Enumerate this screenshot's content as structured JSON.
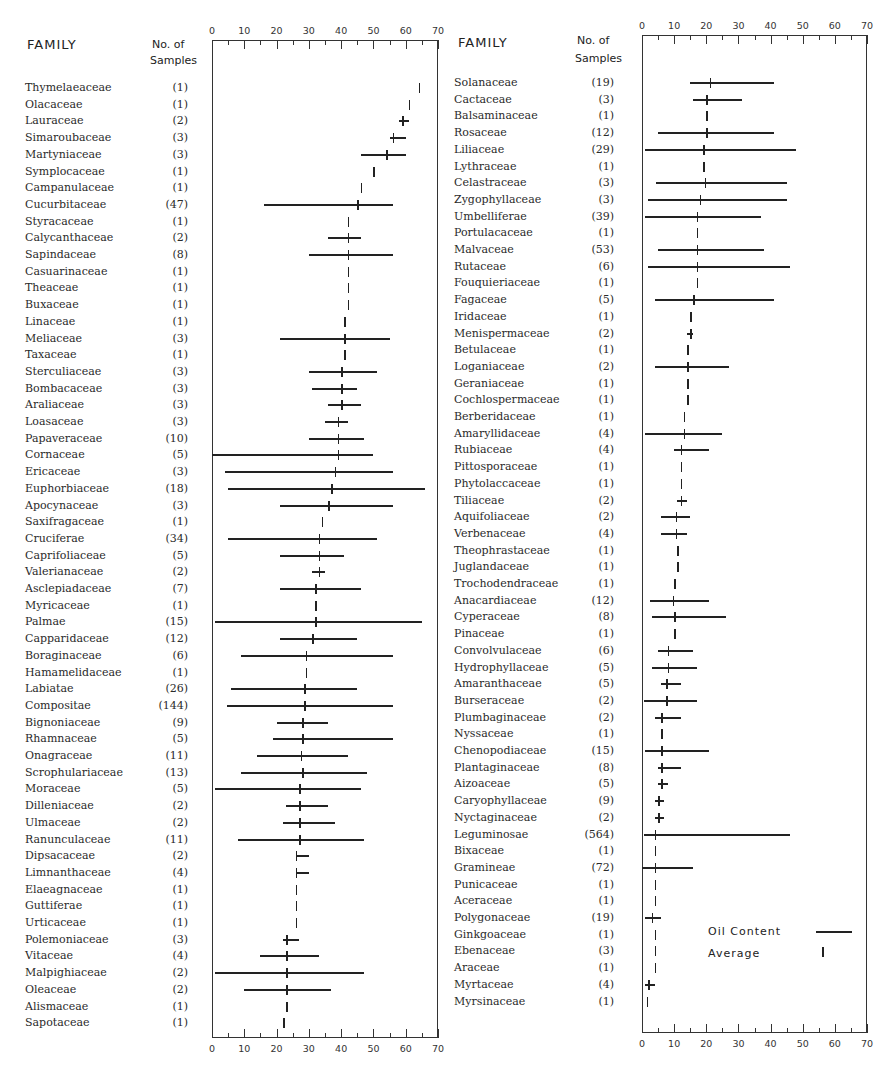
{
  "headers": {
    "family": "FAMILY",
    "samples_line1": "No. of",
    "samples_line2": "Samples"
  },
  "legend": {
    "oil_content": "Oil Content",
    "average": "Average"
  },
  "axis": {
    "ticks": [
      0,
      10,
      20,
      30,
      40,
      50,
      60,
      70
    ],
    "tick_labels": [
      "0",
      "10",
      "20",
      "30",
      "40",
      "50",
      "60",
      "70"
    ]
  },
  "chart_data": [
    {
      "type": "range-bar",
      "title": "Oil content by plant family (left panel)",
      "xlabel": "Oil content (%)",
      "xlim": [
        0,
        70
      ],
      "legend": [
        "Oil Content (range)",
        "Average"
      ],
      "rows": [
        {
          "family": "Thymelaeaceae",
          "n": "(1)",
          "avg": 64,
          "min": null,
          "max": null
        },
        {
          "family": "Olacaceae",
          "n": "(1)",
          "avg": 61,
          "min": null,
          "max": null
        },
        {
          "family": "Lauraceae",
          "n": "(2)",
          "avg": 59,
          "min": 58,
          "max": 61
        },
        {
          "family": "Simaroubaceae",
          "n": "(3)",
          "avg": 56,
          "min": 55,
          "max": 60
        },
        {
          "family": "Martyniaceae",
          "n": "(3)",
          "avg": 54,
          "min": 46,
          "max": 60
        },
        {
          "family": "Symplocaceae",
          "n": "(1)",
          "avg": 50,
          "min": null,
          "max": null
        },
        {
          "family": "Campanulaceae",
          "n": "(1)",
          "avg": 46,
          "min": null,
          "max": null
        },
        {
          "family": "Cucurbitaceae",
          "n": "(47)",
          "avg": 45,
          "min": 16,
          "max": 56
        },
        {
          "family": "Styracaceae",
          "n": "(1)",
          "avg": 42,
          "min": null,
          "max": null
        },
        {
          "family": "Calycanthaceae",
          "n": "(2)",
          "avg": 42,
          "min": 36,
          "max": 46
        },
        {
          "family": "Sapindaceae",
          "n": "(8)",
          "avg": 42,
          "min": 30,
          "max": 56
        },
        {
          "family": "Casuarinaceae",
          "n": "(1)",
          "avg": 42,
          "min": null,
          "max": null
        },
        {
          "family": "Theaceae",
          "n": "(1)",
          "avg": 42,
          "min": null,
          "max": null
        },
        {
          "family": "Buxaceae",
          "n": "(1)",
          "avg": 42,
          "min": null,
          "max": null
        },
        {
          "family": "Linaceae",
          "n": "(1)",
          "avg": 41,
          "min": null,
          "max": null
        },
        {
          "family": "Meliaceae",
          "n": "(3)",
          "avg": 41,
          "min": 21,
          "max": 55
        },
        {
          "family": "Taxaceae",
          "n": "(1)",
          "avg": 41,
          "min": null,
          "max": null
        },
        {
          "family": "Sterculiaceae",
          "n": "(3)",
          "avg": 40,
          "min": 30,
          "max": 51
        },
        {
          "family": "Bombacaceae",
          "n": "(3)",
          "avg": 40,
          "min": 31,
          "max": 45
        },
        {
          "family": "Araliaceae",
          "n": "(3)",
          "avg": 40,
          "min": 36,
          "max": 46
        },
        {
          "family": "Loasaceae",
          "n": "(3)",
          "avg": 39,
          "min": 35,
          "max": 42
        },
        {
          "family": "Papaveraceae",
          "n": "(10)",
          "avg": 39,
          "min": 30,
          "max": 47
        },
        {
          "family": "Cornaceae",
          "n": "(5)",
          "avg": 39,
          "min": 0,
          "max": 50
        },
        {
          "family": "Ericaceae",
          "n": "(3)",
          "avg": 38,
          "min": 4,
          "max": 56
        },
        {
          "family": "Euphorbiaceae",
          "n": "(18)",
          "avg": 37,
          "min": 5,
          "max": 66
        },
        {
          "family": "Apocynaceae",
          "n": "(3)",
          "avg": 36,
          "min": 21,
          "max": 56
        },
        {
          "family": "Saxifragaceae",
          "n": "(1)",
          "avg": 34,
          "min": null,
          "max": null
        },
        {
          "family": "Cruciferae",
          "n": "(34)",
          "avg": 33,
          "min": 5,
          "max": 51
        },
        {
          "family": "Caprifoliaceae",
          "n": "(5)",
          "avg": 33,
          "min": 21,
          "max": 41
        },
        {
          "family": "Valerianaceae",
          "n": "(2)",
          "avg": 33,
          "min": 31,
          "max": 35
        },
        {
          "family": "Asclepiadaceae",
          "n": "(7)",
          "avg": 32,
          "min": 21,
          "max": 46
        },
        {
          "family": "Myricaceae",
          "n": "(1)",
          "avg": 32,
          "min": null,
          "max": null
        },
        {
          "family": "Palmae",
          "n": "(15)",
          "avg": 32,
          "min": 1,
          "max": 65
        },
        {
          "family": "Capparidaceae",
          "n": "(12)",
          "avg": 31,
          "min": 21,
          "max": 45
        },
        {
          "family": "Boraginaceae",
          "n": "(6)",
          "avg": 29,
          "min": 9,
          "max": 56
        },
        {
          "family": "Hamamelidaceae",
          "n": "(1)",
          "avg": 29,
          "min": null,
          "max": null
        },
        {
          "family": "Labiatae",
          "n": "(26)",
          "avg": 28.5,
          "min": 6,
          "max": 45
        },
        {
          "family": "Compositae",
          "n": "(144)",
          "avg": 28.5,
          "min": 4.5,
          "max": 56
        },
        {
          "family": "Bignoniaceae",
          "n": "(9)",
          "avg": 28,
          "min": 20,
          "max": 36
        },
        {
          "family": "Rhamnaceae",
          "n": "(5)",
          "avg": 28,
          "min": 19,
          "max": 56
        },
        {
          "family": "Onagraceae",
          "n": "(11)",
          "avg": 27.5,
          "min": 14,
          "max": 42
        },
        {
          "family": "Scrophulariaceae",
          "n": "(13)",
          "avg": 28,
          "min": 9,
          "max": 48
        },
        {
          "family": "Moraceae",
          "n": "(5)",
          "avg": 27,
          "min": 1,
          "max": 46
        },
        {
          "family": "Dilleniaceae",
          "n": "(2)",
          "avg": 27,
          "min": 23,
          "max": 36
        },
        {
          "family": "Ulmaceae",
          "n": "(2)",
          "avg": 27,
          "min": 22,
          "max": 38
        },
        {
          "family": "Ranunculaceae",
          "n": "(11)",
          "avg": 27,
          "min": 8,
          "max": 47
        },
        {
          "family": "Dipsacaceae",
          "n": "(2)",
          "avg": 26,
          "min": 26,
          "max": 30
        },
        {
          "family": "Limnanthaceae",
          "n": "(4)",
          "avg": 26,
          "min": 26,
          "max": 30
        },
        {
          "family": "Elaeagnaceae",
          "n": "(1)",
          "avg": 26,
          "min": null,
          "max": null
        },
        {
          "family": "Guttiferae",
          "n": "(1)",
          "avg": 26,
          "min": null,
          "max": null
        },
        {
          "family": "Urticaceae",
          "n": "(1)",
          "avg": 26,
          "min": null,
          "max": null
        },
        {
          "family": "Polemoniaceae",
          "n": "(3)",
          "avg": 23,
          "min": 22,
          "max": 27
        },
        {
          "family": "Vitaceae",
          "n": "(4)",
          "avg": 23,
          "min": 15,
          "max": 33
        },
        {
          "family": "Malpighiaceae",
          "n": "(2)",
          "avg": 23,
          "min": 1,
          "max": 47
        },
        {
          "family": "Oleaceae",
          "n": "(2)",
          "avg": 23,
          "min": 10,
          "max": 37
        },
        {
          "family": "Alismaceae",
          "n": "(1)",
          "avg": 23,
          "min": null,
          "max": null
        },
        {
          "family": "Sapotaceae",
          "n": "(1)",
          "avg": 22,
          "min": null,
          "max": null
        }
      ]
    },
    {
      "type": "range-bar",
      "title": "Oil content by plant family (right panel)",
      "xlabel": "Oil content (%)",
      "xlim": [
        0,
        70
      ],
      "legend": [
        "Oil Content (range)",
        "Average"
      ],
      "rows": [
        {
          "family": "Solanaceae",
          "n": "(19)",
          "avg": 21,
          "min": 15,
          "max": 41
        },
        {
          "family": "Cactaceae",
          "n": "(3)",
          "avg": 20,
          "min": 16,
          "max": 31
        },
        {
          "family": "Balsaminaceae",
          "n": "(1)",
          "avg": 20,
          "min": null,
          "max": null
        },
        {
          "family": "Rosaceae",
          "n": "(12)",
          "avg": 20,
          "min": 5,
          "max": 41
        },
        {
          "family": "Liliaceae",
          "n": "(29)",
          "avg": 19,
          "min": 1,
          "max": 48
        },
        {
          "family": "Lythraceae",
          "n": "(1)",
          "avg": 19,
          "min": null,
          "max": null
        },
        {
          "family": "Celastraceae",
          "n": "(3)",
          "avg": 19.5,
          "min": 4.5,
          "max": 45
        },
        {
          "family": "Zygophyllaceae",
          "n": "(3)",
          "avg": 18,
          "min": 2,
          "max": 45
        },
        {
          "family": "Umbelliferae",
          "n": "(39)",
          "avg": 17,
          "min": 1,
          "max": 37
        },
        {
          "family": "Portulacaceae",
          "n": "(1)",
          "avg": 17,
          "min": null,
          "max": null
        },
        {
          "family": "Malvaceae",
          "n": "(53)",
          "avg": 17,
          "min": 5,
          "max": 38
        },
        {
          "family": "Rutaceae",
          "n": "(6)",
          "avg": 17,
          "min": 2,
          "max": 46
        },
        {
          "family": "Fouquieriaceae",
          "n": "(1)",
          "avg": 17,
          "min": null,
          "max": null
        },
        {
          "family": "Fagaceae",
          "n": "(5)",
          "avg": 16,
          "min": 4,
          "max": 41
        },
        {
          "family": "Iridaceae",
          "n": "(1)",
          "avg": 15,
          "min": null,
          "max": null
        },
        {
          "family": "Menispermaceae",
          "n": "(2)",
          "avg": 15,
          "min": 14,
          "max": 16
        },
        {
          "family": "Betulaceae",
          "n": "(1)",
          "avg": 14,
          "min": null,
          "max": null
        },
        {
          "family": "Loganiaceae",
          "n": "(2)",
          "avg": 14,
          "min": 4,
          "max": 27
        },
        {
          "family": "Geraniaceae",
          "n": "(1)",
          "avg": 14,
          "min": null,
          "max": null
        },
        {
          "family": "Cochlospermaceae",
          "n": "(1)",
          "avg": 14,
          "min": null,
          "max": null
        },
        {
          "family": "Berberidaceae",
          "n": "(1)",
          "avg": 13,
          "min": null,
          "max": null
        },
        {
          "family": "Amaryllidaceae",
          "n": "(4)",
          "avg": 13,
          "min": 1,
          "max": 25
        },
        {
          "family": "Rubiaceae",
          "n": "(4)",
          "avg": 12,
          "min": 10,
          "max": 21
        },
        {
          "family": "Pittosporaceae",
          "n": "(1)",
          "avg": 12,
          "min": null,
          "max": null
        },
        {
          "family": "Phytolaccaceae",
          "n": "(1)",
          "avg": 12,
          "min": null,
          "max": null
        },
        {
          "family": "Tiliaceae",
          "n": "(2)",
          "avg": 12,
          "min": 11,
          "max": 14
        },
        {
          "family": "Aquifoliaceae",
          "n": "(2)",
          "avg": 10.5,
          "min": 6,
          "max": 15
        },
        {
          "family": "Verbenaceae",
          "n": "(4)",
          "avg": 10.5,
          "min": 6,
          "max": 14
        },
        {
          "family": "Theophrastaceae",
          "n": "(1)",
          "avg": 11,
          "min": null,
          "max": null
        },
        {
          "family": "Juglandaceae",
          "n": "(1)",
          "avg": 11,
          "min": null,
          "max": null
        },
        {
          "family": "Trochodendraceae",
          "n": "(1)",
          "avg": 10,
          "min": null,
          "max": null
        },
        {
          "family": "Anacardiaceae",
          "n": "(12)",
          "avg": 9.5,
          "min": 2.5,
          "max": 21
        },
        {
          "family": "Cyperaceae",
          "n": "(8)",
          "avg": 10,
          "min": 3,
          "max": 26
        },
        {
          "family": "Pinaceae",
          "n": "(1)",
          "avg": 10,
          "min": null,
          "max": null
        },
        {
          "family": "Convolvulaceae",
          "n": "(6)",
          "avg": 8,
          "min": 5,
          "max": 16
        },
        {
          "family": "Hydrophyllaceae",
          "n": "(5)",
          "avg": 8,
          "min": 3,
          "max": 17
        },
        {
          "family": "Amaranthaceae",
          "n": "(5)",
          "avg": 7.5,
          "min": 6,
          "max": 12
        },
        {
          "family": "Burseraceae",
          "n": "(2)",
          "avg": 7.5,
          "min": 0.5,
          "max": 17
        },
        {
          "family": "Plumbaginaceae",
          "n": "(2)",
          "avg": 6,
          "min": 4,
          "max": 12
        },
        {
          "family": "Nyssaceae",
          "n": "(1)",
          "avg": 6,
          "min": null,
          "max": null
        },
        {
          "family": "Chenopodiaceae",
          "n": "(15)",
          "avg": 6,
          "min": 1,
          "max": 21
        },
        {
          "family": "Plantaginaceae",
          "n": "(8)",
          "avg": 6,
          "min": 5,
          "max": 12
        },
        {
          "family": "Aizoaceae",
          "n": "(5)",
          "avg": 6,
          "min": 5,
          "max": 8
        },
        {
          "family": "Caryophyllaceae",
          "n": "(9)",
          "avg": 5,
          "min": 4,
          "max": 7
        },
        {
          "family": "Nyctaginaceae",
          "n": "(2)",
          "avg": 5,
          "min": 4,
          "max": 7
        },
        {
          "family": "Leguminosae",
          "n": "(564)",
          "avg": 4,
          "min": 0.5,
          "max": 46
        },
        {
          "family": "Bixaceae",
          "n": "(1)",
          "avg": 4,
          "min": null,
          "max": null
        },
        {
          "family": "Gramineae",
          "n": "(72)",
          "avg": 4,
          "min": 0,
          "max": 16
        },
        {
          "family": "Punicaceae",
          "n": "(1)",
          "avg": 4,
          "min": null,
          "max": null
        },
        {
          "family": "Aceraceae",
          "n": "(1)",
          "avg": 4,
          "min": null,
          "max": null
        },
        {
          "family": "Polygonaceae",
          "n": "(19)",
          "avg": 3,
          "min": 1,
          "max": 6
        },
        {
          "family": "Ginkgoaceae",
          "n": "(1)",
          "avg": 4,
          "min": null,
          "max": null
        },
        {
          "family": "Ebenaceae",
          "n": "(3)",
          "avg": 4,
          "min": null,
          "max": null
        },
        {
          "family": "Araceae",
          "n": "(1)",
          "avg": 4,
          "min": null,
          "max": null
        },
        {
          "family": "Myrtaceae",
          "n": "(4)",
          "avg": 2,
          "min": 1,
          "max": 4
        },
        {
          "family": "Myrsinaceae",
          "n": "(1)",
          "avg": 1.5,
          "min": null,
          "max": null
        }
      ]
    }
  ],
  "caption_fragment": "... and the variability of oil"
}
